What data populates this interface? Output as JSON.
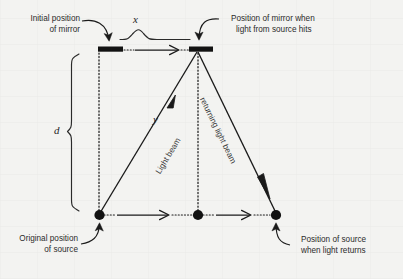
{
  "figure": {
    "kind": "physics-diagram",
    "background_color": "#f3f3f1",
    "ink_color": "#1a1a1a"
  },
  "annotations": {
    "initial_mirror": {
      "line1": "Initial position",
      "line2": "of mirror"
    },
    "mirror_when_hit": {
      "line1": "Position of mirror when",
      "line2": "light from source hits"
    },
    "original_source": {
      "line1": "Original position",
      "line2": "of source"
    },
    "source_when_returns": {
      "line1": "Position of source",
      "line2": "when light returns"
    }
  },
  "measures": {
    "horizontal_displacement": "x",
    "vertical_separation": "d",
    "beam_path_length": "y"
  },
  "beams": {
    "outgoing": "Light beam",
    "returning": "returning light beam"
  },
  "elements": {
    "mirror_initial": "mirror-bar",
    "mirror_final": "mirror-bar",
    "source_initial": "source-dot",
    "source_middle": "source-dot",
    "source_final": "source-dot"
  }
}
